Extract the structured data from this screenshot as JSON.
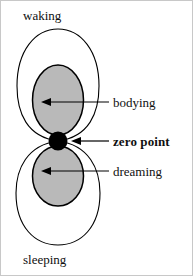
{
  "figure": {
    "background_color": "#ffffff",
    "outline_color": "#000000",
    "lobe_fill_color": "#b9b9b9",
    "zero_point_color": "#000000"
  },
  "labels": {
    "waking": "waking",
    "sleeping": "sleeping",
    "bodying": "bodying",
    "zero_point": "zero point",
    "dreaming": "dreaming"
  },
  "arrows": [
    {
      "name": "bodying-arrow",
      "points_to": "bodying"
    },
    {
      "name": "zero-point-arrow",
      "points_to": "zero point"
    },
    {
      "name": "dreaming-arrow",
      "points_to": "dreaming"
    }
  ],
  "shapes": [
    {
      "name": "upper-outer-lobe",
      "label": "waking",
      "fill": "none"
    },
    {
      "name": "lower-outer-lobe",
      "label": "sleeping",
      "fill": "none"
    },
    {
      "name": "upper-inner-lobe",
      "label": "bodying",
      "fill": "#b9b9b9"
    },
    {
      "name": "lower-inner-lobe",
      "label": "dreaming",
      "fill": "#b9b9b9"
    },
    {
      "name": "zero-point-dot",
      "label": "zero point",
      "fill": "#000000"
    }
  ]
}
